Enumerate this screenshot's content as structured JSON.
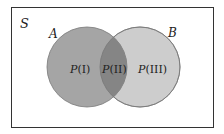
{
  "diagram": {
    "type": "venn",
    "universe_label": "S",
    "sets": [
      {
        "label": "A",
        "fill": "#a5a5a5"
      },
      {
        "label": "B",
        "fill": "#cdcdcd"
      }
    ],
    "intersection_fill": "#858585",
    "regions": [
      {
        "label": "P(I)",
        "italic": "P",
        "rest": "(I)"
      },
      {
        "label": "P(II)",
        "italic": "P",
        "rest": "(II)"
      },
      {
        "label": "P(III)",
        "italic": "P",
        "rest": "(III)"
      }
    ]
  }
}
